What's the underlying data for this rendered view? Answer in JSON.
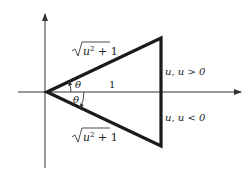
{
  "diagram": {
    "type": "right-triangle on coordinate axes",
    "labels": {
      "hyp_top_radicand_var": "u",
      "hyp_top_exp": "2",
      "hyp_top_rest": " + 1",
      "hyp_bottom_radicand_var": "u",
      "hyp_bottom_exp": "2",
      "hyp_bottom_rest": " + 1",
      "theta_top": "θ",
      "theta_bottom": "θ",
      "adjacent": "1",
      "side_top": "u, u > 0",
      "side_bottom": "u, u < 0"
    },
    "colors": {
      "stroke": "#1a1a1a",
      "axis": "#333333",
      "background": "#ffffff"
    }
  }
}
